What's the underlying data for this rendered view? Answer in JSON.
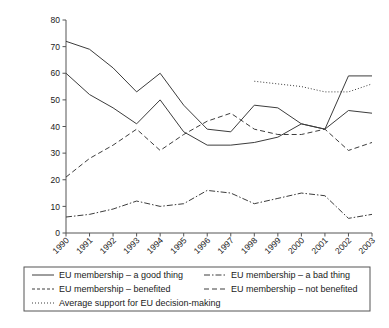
{
  "chart_data": {
    "type": "line",
    "title": "",
    "subtitle": "",
    "xlabel": "",
    "ylabel": "",
    "xlim": [
      1990,
      2003
    ],
    "ylim": [
      0,
      80
    ],
    "ytick_step": 10,
    "grid": false,
    "legend_position": "bottom",
    "categories": [
      "1990",
      "1991",
      "1992",
      "1993",
      "1994",
      "1995",
      "1996",
      "1997",
      "1998",
      "1999",
      "2000",
      "2001",
      "2002",
      "2003"
    ],
    "yticks": [
      "0",
      "10",
      "20",
      "30",
      "40",
      "50",
      "60",
      "70",
      "80"
    ],
    "series": [
      {
        "name": "EU membership – a good thing",
        "style": "solid",
        "color": "#3c3c3c",
        "values": [
          72,
          69,
          62,
          53,
          60,
          48,
          39,
          38,
          48,
          47,
          41,
          39,
          59,
          59
        ]
      },
      {
        "name": "EU membership – benefited",
        "style": "solid",
        "color": "#3c3c3c",
        "values": [
          60,
          52,
          47,
          41,
          50,
          38,
          33,
          33,
          34,
          36,
          41,
          39,
          46,
          45
        ]
      },
      {
        "name": "EU membership – not benefited",
        "style": "dashed",
        "color": "#3c3c3c",
        "values": [
          21,
          28,
          33,
          39,
          31,
          37,
          42,
          45,
          39,
          37,
          37,
          39,
          31,
          34
        ]
      },
      {
        "name": "EU membership – a bad thing",
        "style": "dashdot",
        "color": "#3c3c3c",
        "values": [
          6,
          7,
          9,
          12,
          10,
          11,
          16,
          15,
          11,
          13,
          15,
          14,
          5.5,
          7
        ]
      },
      {
        "name": "Average support for EU decision-making",
        "style": "dotted",
        "color": "#9a9a9a",
        "values": [
          null,
          null,
          null,
          null,
          null,
          null,
          null,
          null,
          57,
          56,
          55,
          53,
          53,
          56
        ]
      }
    ]
  },
  "legend": {
    "entries": [
      {
        "label": "EU membership – a good thing",
        "style": "solid"
      },
      {
        "label": "EU membership – a bad thing",
        "style": "dashdot"
      },
      {
        "label": "EU membership – benefited",
        "style": "dashed-short"
      },
      {
        "label": "EU membership – not benefited",
        "style": "dashed"
      },
      {
        "label": "Average support for EU decision-making",
        "style": "dotted"
      }
    ]
  },
  "caption": {
    "text": ""
  }
}
